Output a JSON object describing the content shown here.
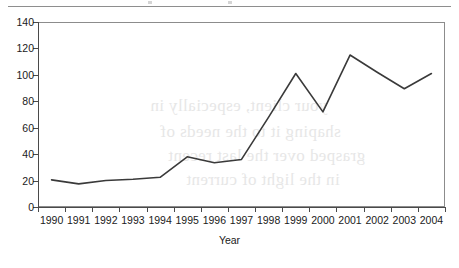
{
  "chart_data": {
    "type": "line",
    "title": "",
    "subtitle": "",
    "xlabel": "Year",
    "ylabel": "",
    "categories": [
      "1990",
      "1991",
      "1992",
      "1993",
      "1994",
      "1995",
      "1996",
      "1997",
      "1998",
      "1999",
      "2000",
      "2001",
      "2002",
      "2003",
      "2004"
    ],
    "values": [
      20.5,
      17.5,
      20,
      21,
      22.5,
      38,
      33.5,
      36,
      68,
      101,
      72,
      115,
      102,
      89.5,
      101
    ],
    "series": [
      {
        "name": "",
        "values": [
          20.5,
          17.5,
          20,
          21,
          22.5,
          38,
          33.5,
          36,
          68,
          101,
          72,
          115,
          102,
          89.5,
          101
        ]
      }
    ],
    "ylim": [
      0,
      140
    ],
    "ytick_values": [
      0,
      20,
      40,
      60,
      80,
      100,
      120,
      140
    ],
    "ytick_labels": [
      "0",
      "20",
      "40",
      "60",
      "80",
      "100",
      "120",
      "140"
    ],
    "xlim_categories": 15,
    "grid": false,
    "legend": false,
    "legend_position": "none",
    "line_color": "#3a3a3a",
    "axis_color": "#4a4a4a",
    "frame_color": "#8c8c8c",
    "background_color": "#ffffff"
  },
  "page": {
    "showthrough_text": [
      "your client, especially in",
      "shaping it to the needs of",
      "grasped over the last recent",
      "in the light of current"
    ]
  }
}
